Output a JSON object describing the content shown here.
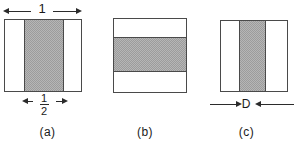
{
  "figure": {
    "type": "technical-diagram",
    "background_color": "#ffffff",
    "line_color": "#4a4a4a",
    "shade_color": "#b6b6b6",
    "panels": [
      {
        "id": "a",
        "caption": "(a)",
        "box": {
          "width_label": "1"
        },
        "band": {
          "orientation": "vertical",
          "position": "center",
          "width_label_numerator": "1",
          "width_label_denominator": "2"
        },
        "dimensions": [
          {
            "name": "outer-width",
            "label": "1",
            "placement": "top",
            "arrows": "outward"
          },
          {
            "name": "band-width",
            "label": "1/2",
            "placement": "bottom",
            "arrows": "outward"
          }
        ]
      },
      {
        "id": "b",
        "caption": "(b)",
        "band": {
          "orientation": "horizontal",
          "position": "center"
        },
        "dimensions": []
      },
      {
        "id": "c",
        "caption": "(c)",
        "band": {
          "orientation": "vertical",
          "position": "center",
          "width_label": "D"
        },
        "dimensions": [
          {
            "name": "band-width",
            "label": "D",
            "placement": "bottom",
            "arrows": "inward"
          }
        ]
      }
    ]
  },
  "labels": {
    "one": "1",
    "fraction_numerator": "1",
    "fraction_denominator": "2",
    "d": "D",
    "caption_a": "(a)",
    "caption_b": "(b)",
    "caption_c": "(c)"
  }
}
